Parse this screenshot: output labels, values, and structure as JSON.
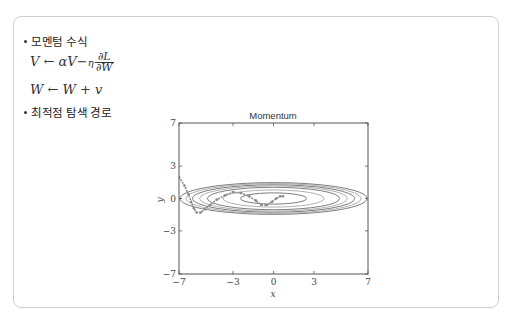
{
  "section1": {
    "label": "모멘텀 수식"
  },
  "formula1": {
    "lhs": "V",
    "arrow": "←",
    "rhs_a": "αV",
    "minus": "−",
    "eta": "η",
    "num": "∂L",
    "den": "∂W"
  },
  "formula2": {
    "text": "W ← W + v"
  },
  "section2": {
    "label": "최적점 탐색 경로"
  },
  "colors": {
    "contour": "#6e6e6e",
    "contour_light": "#a8a8a8",
    "path": "#8c8c8c",
    "axis": "#555555",
    "border": "#cfcfcf"
  },
  "chart_data": {
    "type": "line",
    "title": "Momentum",
    "xlabel": "x",
    "ylabel": "y",
    "xlim": [
      -7,
      7
    ],
    "ylim": [
      -7,
      7
    ],
    "xticks": [
      -7,
      -3,
      0,
      3,
      7
    ],
    "yticks": [
      -7,
      -3,
      0,
      3,
      7
    ],
    "xtick_labels": [
      "−7",
      "−3",
      "0",
      "3",
      "7"
    ],
    "ytick_labels": [
      "−7",
      "−3",
      "0",
      "3",
      "7"
    ],
    "grid": false,
    "contours": {
      "function": "x^2/20 + y^2",
      "levels": [
        0.3,
        0.7,
        1.2,
        1.5,
        1.8,
        2.1,
        2.4
      ]
    },
    "series": [
      {
        "name": "optimization path",
        "x": [
          -7.0,
          -6.6,
          -6.3,
          -6.1,
          -5.9,
          -5.7,
          -5.4,
          -5.1,
          -4.7,
          -4.2,
          -3.6,
          -3.0,
          -2.4,
          -1.8,
          -1.3,
          -0.9,
          -0.5,
          -0.1,
          0.2,
          0.5,
          0.7
        ],
        "y": [
          2.0,
          1.2,
          0.4,
          -0.3,
          -0.9,
          -1.3,
          -1.3,
          -1.0,
          -0.6,
          -0.1,
          0.3,
          0.6,
          0.5,
          0.2,
          -0.2,
          -0.6,
          -0.6,
          -0.3,
          0.0,
          0.2,
          0.2
        ]
      }
    ]
  }
}
